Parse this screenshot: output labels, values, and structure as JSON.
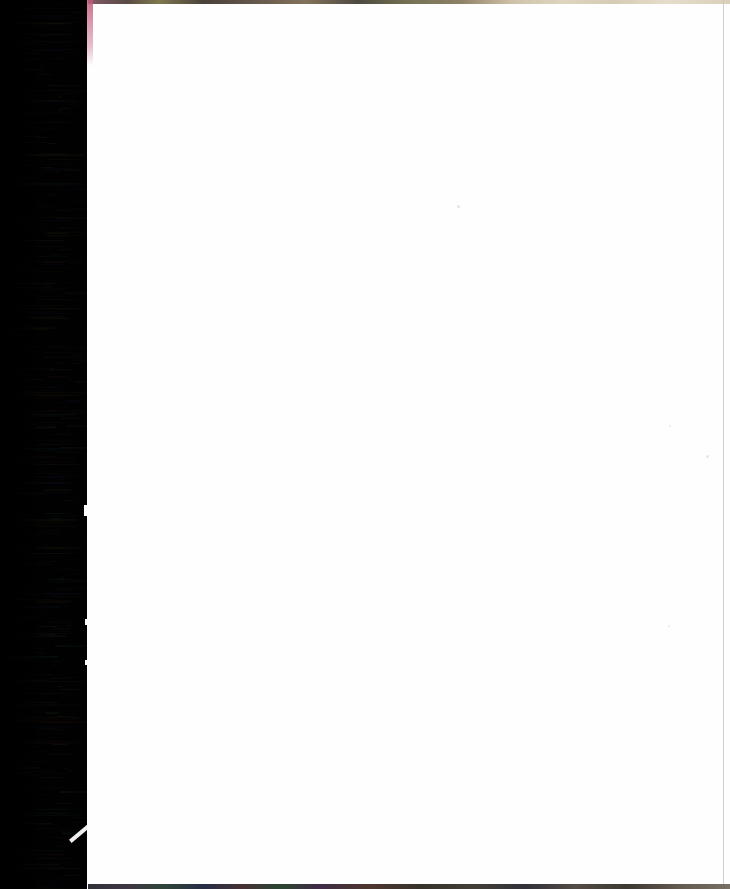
{
  "document": {
    "kind": "scanned-page",
    "title": "Scanned blank page",
    "content_text": "",
    "page_color": "#ffffff",
    "background_color": "#030305",
    "visible_text_lines": []
  },
  "canvas": {
    "width_px": 730,
    "height_px": 889
  },
  "page": {
    "left_px": 87,
    "top_px": 0,
    "width_px": 643,
    "height_px": 889,
    "surface_color": "#fffefe",
    "right_rule_color": "#787882"
  },
  "scanner_edge": {
    "label": "scanner-edge-shadow",
    "left_px": 0,
    "width_px": 88,
    "base_color": "#030305",
    "noise_type": "horizontal-scanline",
    "noise_colors": [
      "#1e3a1c",
      "#3a1418",
      "#141a3a",
      "#2a3a14",
      "#3a2a14",
      "#14303a"
    ]
  },
  "artifacts": {
    "top_strip": {
      "name": "top-edge-noise-strip",
      "height_px": 4,
      "colors": [
        "#6d3f4f",
        "#6a6030",
        "#4a3a2c",
        "#c7b79a",
        "#e0d6c2"
      ]
    },
    "bottom_strip": {
      "name": "bottom-edge-noise-strip",
      "height_px": 5,
      "colors": [
        "#1a1a20",
        "#163022",
        "#301a20",
        "#52483c"
      ]
    },
    "corner_streak": {
      "name": "pink-corner-streak",
      "color": "#be5a78",
      "height_px": 66
    },
    "diagonal_sliver": {
      "name": "diagonal-white-sliver",
      "color": "#fdfdfd",
      "angle_deg": -40
    },
    "notches": [
      {
        "name": "page-edge-notch-upper",
        "top_px": 505,
        "height_px": 11
      },
      {
        "name": "page-edge-notch-middle",
        "top_px": 619,
        "height_px": 6
      },
      {
        "name": "page-edge-notch-lower",
        "top_px": 660,
        "height_px": 5
      }
    ],
    "specks": [
      {
        "name": "dust-speck",
        "left_px": 457,
        "top_px": 205,
        "size_px": 3
      },
      {
        "name": "dust-speck",
        "left_px": 706,
        "top_px": 455,
        "size_px": 3
      },
      {
        "name": "dust-speck",
        "left_px": 669,
        "top_px": 425,
        "size_px": 2
      },
      {
        "name": "dust-speck",
        "left_px": 668,
        "top_px": 625,
        "size_px": 2
      }
    ]
  }
}
